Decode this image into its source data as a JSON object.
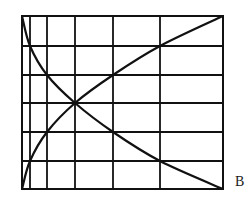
{
  "figure": {
    "label": "B",
    "line_color": "#111111",
    "background": "#ffffff"
  },
  "chart_data": {
    "type": "line",
    "title": "",
    "xlabel": "",
    "ylabel": "",
    "grid": true,
    "legend": "none",
    "annotations": [
      "B"
    ],
    "grid_lines": {
      "vertical_px": [
        22,
        30,
        47,
        75,
        113,
        160,
        223
      ],
      "horizontal_px": [
        16,
        46,
        75,
        103,
        132,
        161,
        189
      ]
    },
    "x": [
      0,
      1,
      2,
      3,
      4,
      5,
      6
    ],
    "series": [
      {
        "name": "increasing curve",
        "values": [
          0,
          1,
          2,
          3,
          4,
          5,
          6
        ]
      },
      {
        "name": "decreasing curve",
        "values": [
          6,
          5,
          4,
          3,
          2,
          1,
          0
        ]
      }
    ],
    "note": "x grid spacing is non-uniform (logarithmic-like); each curve passes diagonally through grid nodes; curves cross at the center node",
    "xlim": [
      0,
      6
    ],
    "ylim": [
      0,
      6
    ]
  }
}
